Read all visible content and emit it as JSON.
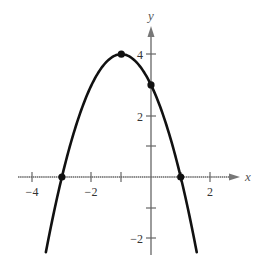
{
  "chart_data": {
    "type": "line",
    "title": "",
    "xlabel": "x",
    "ylabel": "y",
    "function": "y = -x^2 - 2x + 3",
    "xlim": [
      -4.5,
      2.8
    ],
    "ylim": [
      -2.6,
      5.0
    ],
    "grid": false,
    "legend": null,
    "x_ticks": [
      -4,
      -3,
      -2,
      -1,
      1,
      2
    ],
    "x_tick_labels": [
      {
        "value": -4,
        "label": "−4"
      },
      {
        "value": -2,
        "label": "−2"
      },
      {
        "value": 2,
        "label": "2"
      }
    ],
    "y_ticks": [
      -2,
      -1,
      1,
      2,
      3,
      4
    ],
    "y_tick_labels": [
      {
        "value": 4,
        "label": "4"
      },
      {
        "value": 2,
        "label": "2"
      },
      {
        "value": -2,
        "label": "−2"
      }
    ],
    "series": [
      {
        "name": "parabola",
        "x": [
          -3.54,
          -3,
          -2.5,
          -2,
          -1.5,
          -1,
          -0.5,
          0,
          0.5,
          1,
          1.54
        ],
        "y": [
          -2.45,
          0,
          1.75,
          3,
          3.75,
          4,
          3.75,
          3,
          1.75,
          0,
          -2.45
        ]
      }
    ],
    "highlighted_points": [
      {
        "x": -1,
        "y": 4,
        "label": "vertex"
      },
      {
        "x": 0,
        "y": 3,
        "label": "y-intercept"
      },
      {
        "x": -3,
        "y": 0,
        "label": "x-intercept"
      },
      {
        "x": 1,
        "y": 0,
        "label": "x-intercept"
      }
    ]
  },
  "style": {
    "curve_color": "#111111",
    "axis_color": "#666666",
    "point_color": "#111111"
  },
  "labels": {
    "x_axis": "x",
    "y_axis": "y",
    "x_neg4": "−4",
    "x_neg2": "−2",
    "x_2": "2",
    "y_4": "4",
    "y_2": "2",
    "y_neg2": "−2"
  }
}
